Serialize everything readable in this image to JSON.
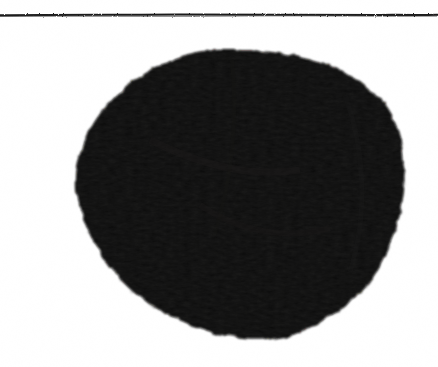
{
  "figure": {
    "kind": "scanned-grayscale-figure",
    "caption_text": "",
    "background_color": "#ffffff",
    "ink_color": "#0a0908",
    "width_px": 438,
    "height_px": 367
  },
  "rule": {
    "name": "horizontal-rule",
    "color": "#1a1a1a",
    "y_px": 15,
    "x_start_px": 0,
    "x_end_px": 438,
    "thickness_px": 2
  },
  "blob": {
    "name": "dark-specimen-blob",
    "fill_color": "#0a0908",
    "edge_color": "#141312",
    "bounds": {
      "left_px": 76,
      "right_px": 405,
      "top_px": 50,
      "bottom_px": 340
    },
    "center_px": {
      "x": 240,
      "y": 196
    },
    "approx_width_px": 329,
    "approx_height_px": 290
  },
  "chart_data": {
    "type": "scatter",
    "title": "",
    "xlabel": "",
    "ylabel": "",
    "xlim": [
      0,
      438
    ],
    "ylim": [
      367,
      0
    ],
    "grid": false,
    "legend": null,
    "annotations": [
      {
        "label": "horizontal rule",
        "y": 15,
        "x_range": [
          0,
          438
        ]
      },
      {
        "label": "blob extent",
        "x_range": [
          76,
          405
        ],
        "y_range": [
          50,
          340
        ]
      }
    ],
    "outline_points": [
      [
        220,
        50
      ],
      [
        262,
        51
      ],
      [
        300,
        57
      ],
      [
        334,
        68
      ],
      [
        360,
        82
      ],
      [
        381,
        100
      ],
      [
        394,
        120
      ],
      [
        401,
        142
      ],
      [
        404,
        166
      ],
      [
        404,
        190
      ],
      [
        400,
        214
      ],
      [
        393,
        238
      ],
      [
        383,
        261
      ],
      [
        370,
        282
      ],
      [
        353,
        300
      ],
      [
        333,
        315
      ],
      [
        311,
        327
      ],
      [
        288,
        335
      ],
      [
        266,
        339
      ],
      [
        244,
        339
      ],
      [
        222,
        335
      ],
      [
        200,
        329
      ],
      [
        178,
        320
      ],
      [
        157,
        309
      ],
      [
        137,
        295
      ],
      [
        119,
        278
      ],
      [
        104,
        259
      ],
      [
        92,
        239
      ],
      [
        83,
        218
      ],
      [
        77,
        198
      ],
      [
        76,
        178
      ],
      [
        79,
        157
      ],
      [
        86,
        137
      ],
      [
        97,
        118
      ],
      [
        112,
        100
      ],
      [
        130,
        84
      ],
      [
        151,
        70
      ],
      [
        174,
        59
      ],
      [
        197,
        52
      ],
      [
        220,
        50
      ]
    ]
  }
}
